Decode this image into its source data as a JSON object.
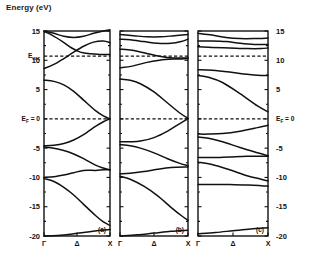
{
  "figure": {
    "axis_title": "Energy (eV)",
    "domain": "electronic band structure",
    "panels_count": 3
  },
  "chart_data": {
    "type": "line",
    "title": "Energy (eV)",
    "xlabel": "",
    "ylabel": "Energy (eV)",
    "ylim": [
      -20,
      15
    ],
    "yticks": [
      15,
      10,
      5,
      0,
      -5,
      -10,
      -15,
      -20
    ],
    "ytick_labels": [
      "15",
      "10",
      "5",
      "0",
      "-5",
      "-10",
      "-15",
      "-20"
    ],
    "right_ytick_labels": [
      "15",
      "10",
      "5",
      "0",
      "-5",
      "-10",
      "-15",
      "-20"
    ],
    "xticks": [
      0,
      0.5,
      1
    ],
    "xtick_labels": [
      "Γ",
      "Δ",
      "X"
    ],
    "grid": false,
    "legend": null,
    "annotations": [
      {
        "name": "vacuum-level",
        "label": "E",
        "sub": "vac",
        "value": 10.7,
        "style": "dashed horizontal line"
      },
      {
        "name": "fermi-level",
        "label": "E",
        "sub": "F",
        "suffix": " = 0",
        "value": 0,
        "style": "dashed horizontal line"
      }
    ],
    "panels": [
      {
        "label": "(a)",
        "series": [
          {
            "name": "band-a1",
            "x": [
              0,
              0.15,
              0.3,
              0.45,
              0.6,
              0.75,
              0.9,
              1.0
            ],
            "values": [
              15.0,
              14.6,
              14.1,
              13.9,
              14.1,
              14.6,
              15.0,
              15.2
            ]
          },
          {
            "name": "band-a2",
            "x": [
              0,
              0.12,
              0.28,
              0.42,
              0.55,
              0.7,
              0.85,
              1.0
            ],
            "values": [
              14.9,
              14.3,
              13.2,
              12.1,
              11.4,
              11.1,
              11.0,
              11.0
            ]
          },
          {
            "name": "band-a3",
            "x": [
              0,
              0.15,
              0.3,
              0.45,
              0.6,
              0.75,
              0.9,
              1.0
            ],
            "values": [
              8.6,
              9.3,
              10.3,
              11.4,
              12.4,
              13.1,
              13.3,
              13.0
            ]
          },
          {
            "name": "band-a4",
            "x": [
              0,
              0.15,
              0.3,
              0.45,
              0.6,
              0.78,
              0.9,
              1.0
            ],
            "values": [
              6.6,
              6.4,
              5.8,
              4.7,
              3.2,
              1.4,
              0.5,
              0.0
            ]
          },
          {
            "name": "band-a5",
            "x": [
              0,
              0.15,
              0.3,
              0.45,
              0.6,
              0.78,
              0.9,
              1.0
            ],
            "values": [
              -4.6,
              -4.5,
              -4.2,
              -3.6,
              -2.7,
              -1.3,
              -0.5,
              0.0
            ]
          },
          {
            "name": "band-a6",
            "x": [
              0,
              0.15,
              0.3,
              0.45,
              0.6,
              0.78,
              0.9,
              1.0
            ],
            "values": [
              -4.8,
              -5.0,
              -5.4,
              -6.0,
              -6.8,
              -7.9,
              -8.4,
              -8.7
            ]
          },
          {
            "name": "band-a7",
            "x": [
              0,
              0.15,
              0.3,
              0.45,
              0.6,
              0.78,
              0.9,
              1.0
            ],
            "values": [
              -10.0,
              -9.9,
              -9.6,
              -9.2,
              -8.8,
              -8.8,
              -8.7,
              -8.7
            ]
          },
          {
            "name": "band-a8",
            "x": [
              0,
              0.15,
              0.3,
              0.45,
              0.6,
              0.78,
              0.9,
              1.0
            ],
            "values": [
              -10.2,
              -10.7,
              -11.7,
              -13.0,
              -14.6,
              -16.5,
              -17.6,
              -18.2
            ]
          },
          {
            "name": "band-a9",
            "x": [
              0,
              0.2,
              0.4,
              0.6,
              0.8,
              1.0
            ],
            "values": [
              -20.0,
              -19.9,
              -19.7,
              -19.4,
              -19.1,
              -18.9
            ]
          }
        ]
      },
      {
        "label": "(b)",
        "series": [
          {
            "name": "band-b1",
            "x": [
              0,
              0.2,
              0.4,
              0.6,
              0.8,
              1.0
            ],
            "values": [
              14.4,
              14.2,
              14.0,
              14.0,
              14.2,
              14.4
            ]
          },
          {
            "name": "band-b2",
            "x": [
              0,
              0.15,
              0.35,
              0.55,
              0.75,
              0.9,
              1.0
            ],
            "values": [
              13.6,
              13.5,
              13.2,
              12.9,
              12.9,
              13.2,
              13.6
            ]
          },
          {
            "name": "band-b3",
            "x": [
              0,
              0.18,
              0.38,
              0.58,
              0.78,
              1.0
            ],
            "values": [
              11.9,
              11.7,
              11.2,
              10.7,
              10.4,
              10.4
            ]
          },
          {
            "name": "band-b4",
            "x": [
              0,
              0.18,
              0.38,
              0.58,
              0.78,
              1.0
            ],
            "values": [
              8.7,
              9.0,
              9.6,
              10.0,
              10.2,
              10.3
            ]
          },
          {
            "name": "band-b5",
            "x": [
              0,
              0.15,
              0.3,
              0.5,
              0.7,
              0.88,
              1.0
            ],
            "values": [
              6.8,
              6.6,
              6.0,
              4.6,
              2.7,
              1.0,
              0.1
            ]
          },
          {
            "name": "band-b6",
            "x": [
              0,
              0.15,
              0.3,
              0.5,
              0.7,
              0.88,
              1.0
            ],
            "values": [
              -3.9,
              -3.9,
              -3.8,
              -3.2,
              -2.1,
              -0.8,
              0.0
            ]
          },
          {
            "name": "band-b7",
            "x": [
              0,
              0.15,
              0.3,
              0.5,
              0.7,
              0.88,
              1.0
            ],
            "values": [
              -4.4,
              -4.6,
              -5.0,
              -5.8,
              -6.8,
              -7.6,
              -8.0
            ]
          },
          {
            "name": "band-b8",
            "x": [
              0,
              0.15,
              0.35,
              0.55,
              0.75,
              1.0
            ],
            "values": [
              -9.4,
              -9.3,
              -9.0,
              -8.6,
              -8.3,
              -8.2
            ]
          },
          {
            "name": "band-b9",
            "x": [
              0,
              0.15,
              0.35,
              0.55,
              0.75,
              0.9,
              1.0
            ],
            "values": [
              -9.8,
              -10.3,
              -11.5,
              -13.1,
              -15.1,
              -16.5,
              -17.3
            ]
          },
          {
            "name": "band-b10",
            "x": [
              0,
              0.25,
              0.5,
              0.75,
              1.0
            ],
            "values": [
              -20.0,
              -19.8,
              -19.5,
              -19.2,
              -19.0
            ]
          }
        ]
      },
      {
        "label": "(c)",
        "series": [
          {
            "name": "band-c1",
            "x": [
              0,
              0.2,
              0.4,
              0.6,
              0.8,
              1.0
            ],
            "values": [
              14.6,
              14.3,
              13.9,
              13.7,
              13.7,
              13.8
            ]
          },
          {
            "name": "band-c2",
            "x": [
              0,
              0.2,
              0.4,
              0.6,
              0.8,
              1.0
            ],
            "values": [
              13.3,
              13.3,
              13.2,
              12.9,
              12.7,
              12.7
            ]
          },
          {
            "name": "band-c3",
            "x": [
              0,
              0.2,
              0.45,
              0.7,
              0.9,
              1.0
            ],
            "values": [
              12.3,
              12.2,
              12.1,
              12.0,
              12.0,
              12.1
            ]
          },
          {
            "name": "band-c4",
            "x": [
              0,
              0.2,
              0.45,
              0.7,
              0.9,
              1.0
            ],
            "values": [
              8.4,
              8.3,
              8.0,
              7.6,
              7.4,
              7.4
            ]
          },
          {
            "name": "band-c5",
            "x": [
              0,
              0.15,
              0.35,
              0.6,
              0.85,
              1.0
            ],
            "values": [
              7.4,
              7.1,
              6.2,
              4.3,
              2.2,
              1.2
            ]
          },
          {
            "name": "band-c6",
            "x": [
              0,
              0.15,
              0.35,
              0.6,
              0.85,
              1.0
            ],
            "values": [
              -2.6,
              -2.6,
              -2.5,
              -2.1,
              -1.5,
              -1.1
            ]
          },
          {
            "name": "band-c7",
            "x": [
              0,
              0.15,
              0.35,
              0.6,
              0.85,
              1.0
            ],
            "values": [
              -3.1,
              -3.3,
              -3.9,
              -4.9,
              -5.8,
              -6.3
            ]
          },
          {
            "name": "band-c8",
            "x": [
              0,
              0.2,
              0.45,
              0.7,
              1.0
            ],
            "values": [
              -6.6,
              -6.6,
              -6.5,
              -6.4,
              -6.4
            ]
          },
          {
            "name": "band-c9",
            "x": [
              0,
              0.2,
              0.45,
              0.7,
              0.9,
              1.0
            ],
            "values": [
              -7.4,
              -7.8,
              -8.7,
              -9.7,
              -10.3,
              -10.6
            ]
          },
          {
            "name": "band-c10",
            "x": [
              0,
              0.2,
              0.45,
              0.7,
              0.9,
              1.0
            ],
            "values": [
              -11.2,
              -11.2,
              -11.2,
              -11.3,
              -11.4,
              -11.5
            ]
          },
          {
            "name": "band-c11",
            "x": [
              0,
              0.25,
              0.5,
              0.75,
              1.0
            ],
            "values": [
              -19.6,
              -19.4,
              -19.1,
              -18.8,
              -18.6
            ]
          }
        ]
      }
    ]
  }
}
